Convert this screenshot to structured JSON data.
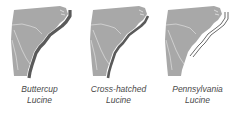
{
  "figure": {
    "panels": [
      {
        "id": "buttercup",
        "caption_line1": "Buttercup",
        "caption_line2": "Lucine",
        "range_style": "solid-coastal-band"
      },
      {
        "id": "cross-hatched",
        "caption_line1": "Cross-hatched",
        "caption_line2": "Lucine",
        "range_style": "bold-coastal-band"
      },
      {
        "id": "pennsylvania",
        "caption_line1": "Pennsylvania",
        "caption_line2": "Lucine",
        "range_style": "offshore-double-line"
      }
    ],
    "colors": {
      "land": "#a8a8a8",
      "state_border": "#d8d8d8",
      "range": "#5a5a5a",
      "caption": "#4a4a4a",
      "background": "#ffffff"
    }
  }
}
